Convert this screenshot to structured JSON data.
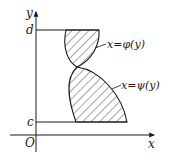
{
  "diagram": {
    "type": "region-between-curves",
    "axes": {
      "x_label": "x",
      "y_label": "y",
      "origin_label": "O"
    },
    "bounds": {
      "upper_label": "d",
      "lower_label": "c"
    },
    "curves": [
      {
        "name": "phi",
        "label": "x=φ(y)"
      },
      {
        "name": "psi",
        "label": "x=ψ(y)"
      }
    ],
    "region": {
      "fill": "hatched",
      "hatch_color": "#1a1a1a"
    }
  }
}
